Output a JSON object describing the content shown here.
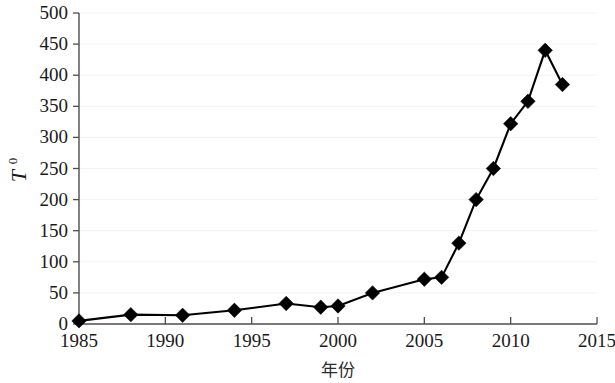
{
  "chart_data": {
    "type": "line",
    "title": "",
    "xlabel": "年份",
    "ylabel": "T0",
    "ylabel_base": "T",
    "ylabel_sub": "0",
    "xlim": [
      1985,
      2015
    ],
    "ylim": [
      0,
      500
    ],
    "xticks": [
      "1985",
      "1990",
      "1995",
      "2000",
      "2005",
      "2010",
      "2015"
    ],
    "xtick_values": [
      1985,
      1990,
      1995,
      2000,
      2005,
      2010,
      2015
    ],
    "yticks": [
      "0",
      "50",
      "100",
      "150",
      "200",
      "250",
      "300",
      "350",
      "400",
      "450",
      "500"
    ],
    "ytick_values": [
      0,
      50,
      100,
      150,
      200,
      250,
      300,
      350,
      400,
      450,
      500
    ],
    "grid": true,
    "grid_axis": "y",
    "legend": "none",
    "marker": "diamond",
    "line_color": "#000000",
    "marker_color": "#000000",
    "x": [
      1985,
      1988,
      1991,
      1994,
      1997,
      1999,
      2000,
      2002,
      2005,
      2006,
      2007,
      2008,
      2009,
      2010,
      2011,
      2012,
      2013
    ],
    "values": [
      5,
      15,
      14,
      22,
      33,
      27,
      29,
      50,
      72,
      75,
      130,
      200,
      250,
      322,
      358,
      440,
      385
    ],
    "series": [
      {
        "name": "T0",
        "points": [
          {
            "x": 1985,
            "y": 5
          },
          {
            "x": 1988,
            "y": 15
          },
          {
            "x": 1991,
            "y": 14
          },
          {
            "x": 1994,
            "y": 22
          },
          {
            "x": 1997,
            "y": 33
          },
          {
            "x": 1999,
            "y": 27
          },
          {
            "x": 2000,
            "y": 29
          },
          {
            "x": 2002,
            "y": 50
          },
          {
            "x": 2005,
            "y": 72
          },
          {
            "x": 2006,
            "y": 75
          },
          {
            "x": 2007,
            "y": 130
          },
          {
            "x": 2008,
            "y": 200
          },
          {
            "x": 2009,
            "y": 250
          },
          {
            "x": 2010,
            "y": 322
          },
          {
            "x": 2011,
            "y": 358
          },
          {
            "x": 2012,
            "y": 440
          },
          {
            "x": 2013,
            "y": 385
          }
        ]
      }
    ]
  }
}
